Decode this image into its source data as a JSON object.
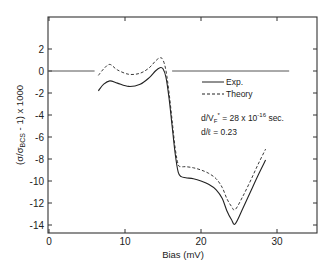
{
  "chart_data": {
    "type": "line",
    "title": "",
    "xlabel": "Bias (mV)",
    "ylabel_parts": {
      "open": "(σ/σ",
      "sub": "BCS",
      "close": " - 1) x 1000"
    },
    "xlim": [
      0,
      35
    ],
    "ylim": [
      -15,
      4.8
    ],
    "xticks": [
      0,
      10,
      20,
      30
    ],
    "xtick_labels": [
      "0",
      "10",
      "20",
      "30"
    ],
    "yticks": [
      2,
      0,
      -2,
      -4,
      -6,
      -8,
      -10,
      -12,
      -14
    ],
    "ytick_labels": [
      "2",
      "0",
      "-2",
      "-4",
      "-6",
      "-8",
      "-10",
      "-12",
      "-14"
    ],
    "grid": false,
    "reference_line": {
      "y": 0,
      "segments": [
        [
          0,
          6
        ],
        [
          16.2,
          31.6
        ]
      ]
    },
    "legend": {
      "position": "inside-right",
      "entries": [
        {
          "label": "Exp.",
          "style": "solid"
        },
        {
          "label": "Theory",
          "style": "dashed"
        }
      ]
    },
    "annotations": [
      {
        "text": "d/V",
        "sub": "F",
        "sup": "*",
        "rest": " = 28 x 10",
        "exp": "-16",
        "tail": " sec."
      },
      {
        "text": "d/ℓ = 0.23"
      }
    ],
    "series": [
      {
        "name": "Exp.",
        "style": "solid",
        "x": [
          6.5,
          7.2,
          8.0,
          9.0,
          10.5,
          12.0,
          13.2,
          14.0,
          14.6,
          15.0,
          15.4,
          15.8,
          16.2,
          16.6,
          17.0,
          17.4,
          18.0,
          19.0,
          20.0,
          21.0,
          22.0,
          22.8,
          23.4,
          24.0,
          24.5,
          25.5,
          26.5,
          27.5,
          28.5
        ],
        "values": [
          -1.8,
          -1.2,
          -0.9,
          -1.1,
          -1.4,
          -1.2,
          -0.6,
          0.0,
          0.3,
          0.2,
          -0.6,
          -2.5,
          -5.0,
          -7.5,
          -9.2,
          -9.6,
          -9.7,
          -9.8,
          -10.0,
          -10.3,
          -10.8,
          -11.6,
          -12.7,
          -13.5,
          -13.9,
          -12.5,
          -11.0,
          -9.5,
          -8.1
        ]
      },
      {
        "name": "Theory",
        "style": "dashed",
        "x": [
          6.5,
          7.2,
          8.0,
          9.0,
          10.5,
          12.0,
          13.2,
          14.0,
          14.6,
          15.0,
          15.4,
          15.8,
          16.2,
          16.6,
          17.0,
          17.4,
          18.0,
          19.0,
          20.0,
          21.0,
          22.0,
          22.8,
          23.4,
          24.0,
          24.5,
          25.5,
          26.5,
          27.5,
          28.5
        ],
        "values": [
          -0.4,
          0.2,
          0.6,
          0.1,
          -0.3,
          -0.2,
          0.3,
          0.9,
          1.2,
          1.0,
          0.0,
          -2.0,
          -4.5,
          -7.0,
          -8.5,
          -8.7,
          -8.7,
          -8.8,
          -9.0,
          -9.3,
          -9.8,
          -10.6,
          -11.6,
          -12.3,
          -12.6,
          -11.4,
          -10.0,
          -8.5,
          -7.1
        ]
      }
    ]
  }
}
